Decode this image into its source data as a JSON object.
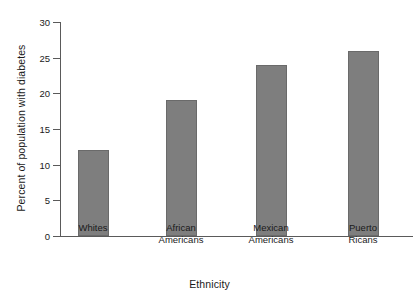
{
  "chart_data": {
    "type": "bar",
    "title": "",
    "xlabel": "Ethnicity",
    "ylabel": "Percent of population with diabetes",
    "categories": [
      "Whites",
      "African Americans",
      "Mexican Americans",
      "Puerto Ricans"
    ],
    "category_lines": [
      [
        "Whites"
      ],
      [
        "African",
        "Americans"
      ],
      [
        "Mexican",
        "Americans"
      ],
      [
        "Puerto",
        "Ricans"
      ]
    ],
    "values": [
      12,
      19,
      24,
      26
    ],
    "ylim": [
      0,
      30
    ],
    "yticks": [
      0,
      5,
      10,
      15,
      20,
      25,
      30
    ],
    "ytick_labels": [
      "0",
      "5",
      "10",
      "15",
      "20",
      "25",
      "30"
    ],
    "grid": false,
    "legend": null,
    "bar_color": "#7e7e7e",
    "bar_edge_color": "#6a6a6a",
    "axis_color": "#5a5a5a",
    "background_color": "#ffffff",
    "text_color": "#1a1a1a"
  }
}
